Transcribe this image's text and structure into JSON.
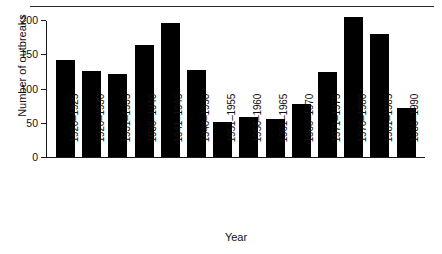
{
  "chart_data": {
    "type": "bar",
    "title": "",
    "xlabel": "Year",
    "ylabel": "Number of outbreaks",
    "categories": [
      "1920–1925",
      "1926–1930",
      "1931–1935",
      "1936–1940",
      "1941–1945",
      "1946–1950",
      "1951–1955",
      "1956–1960",
      "1961–1965",
      "1966–1970",
      "1971–1975",
      "1976–1980",
      "1981–1985",
      "1986–1990"
    ],
    "values": [
      141,
      126,
      121,
      164,
      196,
      127,
      51,
      59,
      56,
      77,
      124,
      204,
      180,
      72
    ],
    "ylim": [
      0,
      200
    ],
    "yticks": [
      0,
      50,
      100,
      150,
      200
    ],
    "ytick_labels": [
      "0",
      "50",
      "100",
      "150",
      "200"
    ],
    "grid": false,
    "legend": false,
    "bar_color": "#000000",
    "axis_color": "#1a1a1a",
    "background": "#ffffff"
  },
  "figure": {
    "top_rule": true,
    "xtick_rotation": -90
  }
}
